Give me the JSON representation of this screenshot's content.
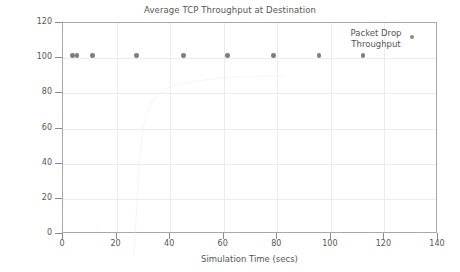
{
  "chart_data": {
    "type": "scatter",
    "title": "Average TCP Throughput at Destination",
    "xlabel": "Simulation Time (secs)",
    "ylabel": "Average Throughput (kbps)",
    "xlim": [
      0,
      140
    ],
    "ylim": [
      0,
      120
    ],
    "xticks": [
      0,
      20,
      40,
      60,
      80,
      100,
      120,
      140
    ],
    "yticks": [
      0,
      20,
      40,
      60,
      80,
      100,
      120
    ],
    "xtick_labels": [
      "0",
      "20",
      "40",
      "60",
      "80",
      "100",
      "120",
      "140"
    ],
    "ytick_labels": [
      "0",
      "20",
      "40",
      "60",
      "80",
      "100",
      "120"
    ],
    "grid": true,
    "legend_position": "top-right",
    "series": [
      {
        "name": "Packet Drop Throughput",
        "marker": "filled-circle",
        "color": "#7f7f7f",
        "x": [
          3.5,
          5.2,
          11.0,
          27.5,
          45.0,
          61.5,
          78.5,
          95.5,
          112.0
        ],
        "y": [
          101.5,
          101.5,
          101.5,
          101.5,
          101.5,
          101.5,
          101.5,
          101.5,
          101.5
        ]
      }
    ]
  },
  "legend": {
    "line1": "Packet Drop",
    "line2": "Throughput"
  },
  "colors": {
    "marker": "#7f7f7f",
    "axis": "#a8a8a8",
    "grid": "#ececec",
    "text": "#555555",
    "background": "#ffffff"
  }
}
